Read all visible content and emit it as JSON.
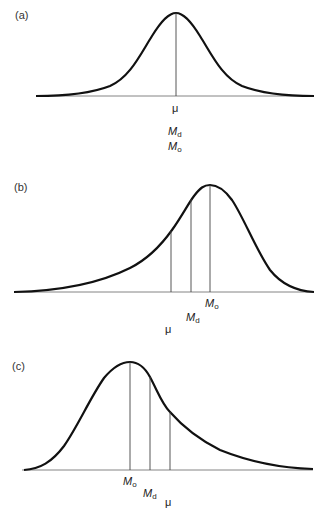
{
  "panels": [
    {
      "id": "a",
      "label": "(a)",
      "description": "Symmetric distribution",
      "markers": [
        {
          "symbol": "μ",
          "sub": ""
        },
        {
          "symbol": "M",
          "sub": "d"
        },
        {
          "symbol": "M",
          "sub": "o"
        }
      ]
    },
    {
      "id": "b",
      "label": "(b)",
      "description": "Negatively (left) skewed distribution",
      "markers": [
        {
          "symbol": "M",
          "sub": "o"
        },
        {
          "symbol": "M",
          "sub": "d"
        },
        {
          "symbol": "μ",
          "sub": ""
        }
      ]
    },
    {
      "id": "c",
      "label": "(c)",
      "description": "Positively (right) skewed distribution",
      "markers": [
        {
          "symbol": "M",
          "sub": "o"
        },
        {
          "symbol": "M",
          "sub": "d"
        },
        {
          "symbol": "μ",
          "sub": ""
        }
      ]
    }
  ],
  "colors": {
    "curve": "#111111",
    "axis": "#555555",
    "marker_line": "#444444"
  }
}
